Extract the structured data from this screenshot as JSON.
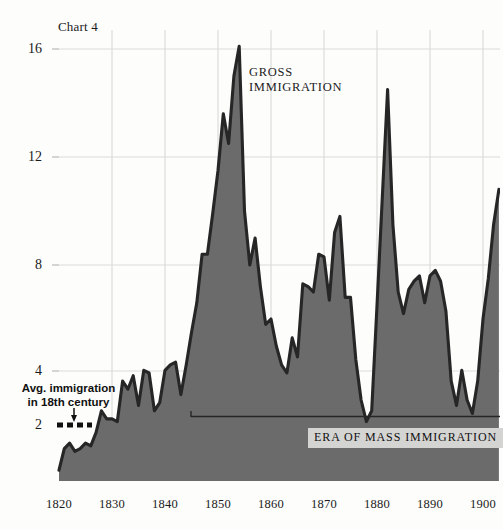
{
  "chart_data": {
    "type": "area",
    "title": "Chart 4",
    "xlabel": "",
    "ylabel": "",
    "xlim": [
      1820,
      1903
    ],
    "ylim": [
      0,
      17.2
    ],
    "grid": true,
    "legend_position": "inline-annotation",
    "xticks": [
      "1820",
      "1830",
      "1840",
      "1850",
      "1860",
      "1870",
      "1880",
      "1890",
      "1900"
    ],
    "xtick_values": [
      1820,
      1830,
      1840,
      1850,
      1860,
      1870,
      1880,
      1890,
      1900
    ],
    "yticks": [
      "16",
      "12",
      "8",
      "4",
      "2"
    ],
    "ytick_values": [
      16,
      12,
      8,
      4,
      2
    ],
    "series": [
      {
        "name": "GROSS IMMIGRATION",
        "fill_color": "#6b6b6b",
        "line_color": "#262626",
        "x": [
          1820,
          1821,
          1822,
          1823,
          1824,
          1825,
          1826,
          1827,
          1828,
          1829,
          1830,
          1831,
          1832,
          1833,
          1834,
          1835,
          1836,
          1837,
          1838,
          1839,
          1840,
          1841,
          1842,
          1843,
          1844,
          1845,
          1846,
          1847,
          1848,
          1849,
          1850,
          1851,
          1852,
          1853,
          1854,
          1855,
          1856,
          1857,
          1858,
          1859,
          1860,
          1861,
          1862,
          1863,
          1864,
          1865,
          1866,
          1867,
          1868,
          1869,
          1870,
          1871,
          1872,
          1873,
          1874,
          1875,
          1876,
          1877,
          1878,
          1879,
          1880,
          1881,
          1882,
          1883,
          1884,
          1885,
          1886,
          1887,
          1888,
          1889,
          1890,
          1891,
          1892,
          1893,
          1894,
          1895,
          1896,
          1897,
          1898,
          1899,
          1900,
          1901,
          1902,
          1903
        ],
        "y": [
          0.4,
          1.2,
          1.4,
          1.1,
          1.2,
          1.4,
          1.3,
          1.8,
          2.6,
          2.3,
          2.3,
          2.2,
          3.7,
          3.4,
          3.9,
          2.8,
          4.1,
          4.0,
          2.6,
          2.9,
          4.1,
          4.3,
          4.4,
          3.2,
          4.3,
          5.5,
          6.6,
          8.4,
          8.4,
          9.9,
          11.5,
          13.6,
          12.5,
          15.0,
          16.1,
          10.0,
          8.0,
          9.0,
          7.2,
          5.8,
          6.0,
          5.0,
          4.3,
          4.0,
          5.3,
          4.6,
          7.3,
          7.2,
          7.0,
          8.4,
          8.3,
          6.7,
          9.2,
          9.8,
          6.8,
          6.8,
          4.5,
          3.0,
          2.2,
          2.6,
          6.5,
          10.5,
          14.5,
          9.5,
          7.0,
          6.2,
          7.1,
          7.4,
          7.6,
          6.6,
          7.6,
          7.8,
          7.4,
          6.3,
          3.7,
          2.8,
          4.1,
          3.0,
          2.5,
          3.7,
          6.0,
          7.5,
          9.5,
          10.8
        ]
      }
    ],
    "annotations": [
      {
        "id": "series-label",
        "text_lines": [
          "GROSS",
          "IMMIGRATION"
        ],
        "x": 1855,
        "y": 15.3
      },
      {
        "id": "avg-immigration-annotation",
        "text_lines": [
          "Avg. immigration",
          "in 18th century"
        ],
        "marker": "dashed-line",
        "pointer": "down-arrow",
        "value": 2
      },
      {
        "id": "era-bracket",
        "label": "ERA OF MASS IMMIGRATION",
        "x_start": 1845,
        "x_end": 1903,
        "y": 2.45
      }
    ]
  },
  "labels": {
    "title": "Chart 4",
    "series_line_1": "GROSS",
    "series_line_2": "IMMIGRATION",
    "avg_line_1": "Avg. immigration",
    "avg_line_2": "in 18th century",
    "era": "ERA OF MASS IMMIGRATION"
  },
  "colors": {
    "background": "#fdfdfb",
    "area_fill": "#6b6b6b",
    "area_line": "#262626",
    "gridline": "#d8d8d6",
    "era_label_bg": "#d4d4d2",
    "text": "#1b1b1b"
  }
}
